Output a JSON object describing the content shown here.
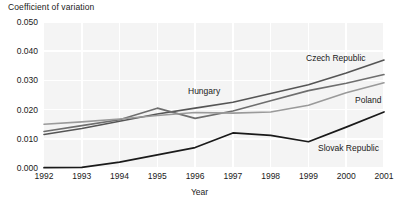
{
  "chart_data": {
    "type": "line",
    "title": "",
    "xlabel": "Year",
    "ylabel": "Coefficient of variation",
    "grid": true,
    "legend_position": "inline-labels",
    "x": [
      1992,
      1993,
      1994,
      1995,
      1996,
      1997,
      1998,
      1999,
      2000,
      2001
    ],
    "categories": [
      "1992",
      "1993",
      "1994",
      "1995",
      "1996",
      "1997",
      "1998",
      "1999",
      "2000",
      "2001"
    ],
    "xlim": [
      1992,
      2001
    ],
    "ylim": [
      0.0,
      0.05
    ],
    "ytick_labels": [
      "0.000",
      "0.010",
      "0.020",
      "0.030",
      "0.040",
      "0.050"
    ],
    "ytick_values": [
      0.0,
      0.01,
      0.02,
      0.03,
      0.04,
      0.05
    ],
    "series": [
      {
        "name": "Czech Republic",
        "color": "#555555",
        "width": 1.6,
        "values": [
          0.0115,
          0.0135,
          0.016,
          0.0185,
          0.0205,
          0.0225,
          0.0255,
          0.0285,
          0.0325,
          0.037
        ]
      },
      {
        "name": "Hungary",
        "color": "#6e6e6e",
        "width": 1.6,
        "values": [
          0.0125,
          0.0145,
          0.0165,
          0.0205,
          0.017,
          0.0195,
          0.023,
          0.0265,
          0.029,
          0.032
        ]
      },
      {
        "name": "Poland",
        "color": "#9a9a9a",
        "width": 1.6,
        "values": [
          0.015,
          0.0158,
          0.0168,
          0.018,
          0.019,
          0.0188,
          0.0192,
          0.0215,
          0.0258,
          0.0292
        ]
      },
      {
        "name": "Slovak Republic",
        "color": "#1a1a1a",
        "width": 1.7,
        "values": [
          0.0001,
          0.0002,
          0.002,
          0.0045,
          0.007,
          0.012,
          0.0112,
          0.009,
          0.014,
          0.0192
        ]
      }
    ],
    "annotations": [
      {
        "text": "Czech Republic",
        "x_px": 306,
        "y_px": 53
      },
      {
        "text": "Hungary",
        "x_px": 188,
        "y_px": 86
      },
      {
        "text": "Poland",
        "x_px": 355,
        "y_px": 95
      },
      {
        "text": "Slovak Republic",
        "x_px": 318,
        "y_px": 143
      }
    ],
    "style": {
      "plot_background": "#f4f4f4",
      "gridline_color": "#ffffff",
      "text_color": "#1a1a1a"
    }
  }
}
